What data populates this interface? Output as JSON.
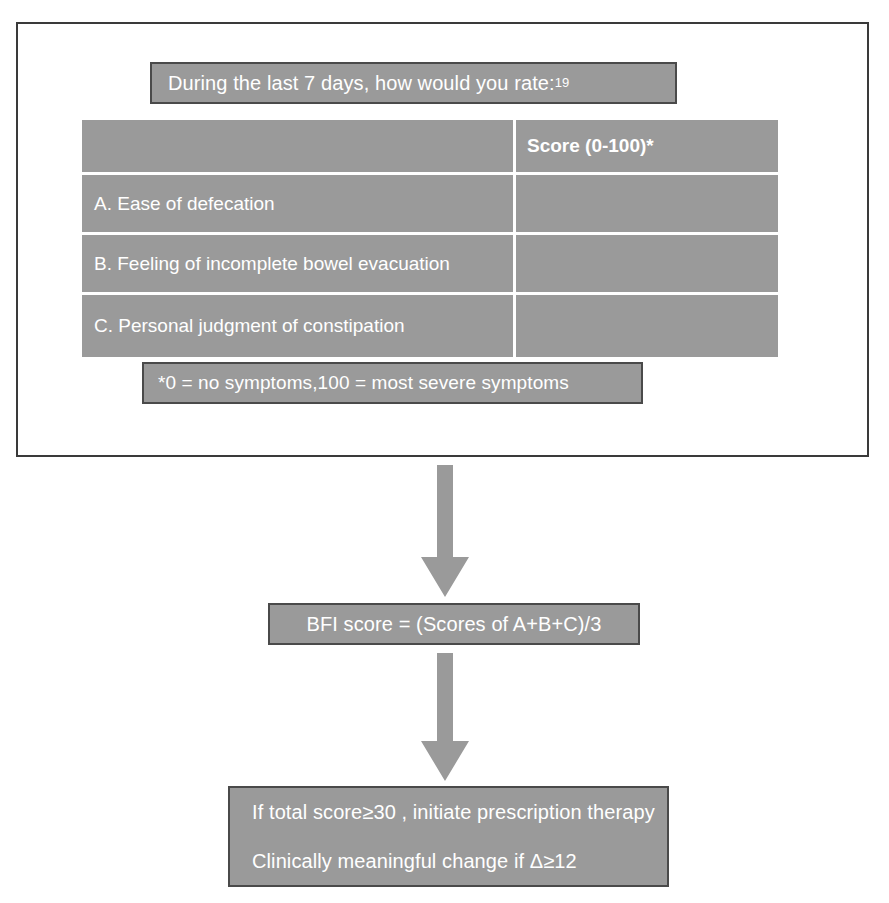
{
  "diagram": {
    "colors": {
      "box_fill": "#9a9a9a",
      "box_border": "#4a4a4a",
      "panel_border": "#3a3a3a",
      "text": "#ffffff",
      "gridline": "#ffffff",
      "arrow": "#9a9a9a"
    }
  },
  "questionnaire": {
    "header": "During the last 7 days, how would you rate:",
    "header_superscript": "19",
    "table": {
      "columns": [
        "",
        "Score (0-100)*"
      ],
      "rows": [
        {
          "label": "A. Ease of defecation",
          "score": ""
        },
        {
          "label": "B. Feeling of incomplete bowel evacuation",
          "score": ""
        },
        {
          "label": "C. Personal judgment of constipation",
          "score": ""
        }
      ]
    },
    "footnote": "*0 = no symptoms,100 = most severe symptoms"
  },
  "flow": {
    "arrow_1_label": "down-arrow",
    "score_formula": "BFI score = (Scores of A+B+C)/3",
    "arrow_2_label": "down-arrow",
    "recommendation": {
      "line_1": "If total score≥30 , initiate prescription therapy",
      "line_2": "Clinically meaningful change if Δ≥12"
    }
  }
}
